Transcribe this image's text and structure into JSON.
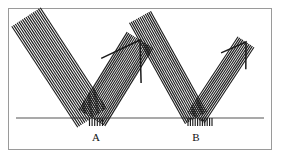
{
  "figure": {
    "background_color": "#ffffff",
    "frame": {
      "border_color": "#9a9a9a",
      "x": 8,
      "y": 8,
      "width": 264,
      "height": 142
    },
    "surface": {
      "name": "reflecting-surface-line",
      "color": "#8d8d8d",
      "x1": 16,
      "y1": 118,
      "x2": 264,
      "y2": 118,
      "stroke_width": 1.3
    },
    "labels": [
      {
        "id": "A",
        "text": "A",
        "x": 96,
        "y": 131,
        "color": "#111111"
      },
      {
        "id": "B",
        "text": "B",
        "x": 196,
        "y": 131,
        "color": "#111111"
      }
    ],
    "beam_color": "#1b1b1b",
    "beams": [
      {
        "id": "A",
        "label": "A",
        "incident": {
          "name": "incident-beam-a",
          "ray_count": 17,
          "width": 34,
          "angle_deg": 58,
          "start_x": 26,
          "start_y": 17,
          "hit_x": 92,
          "hit_y": 118,
          "has_arrowhead": false
        },
        "reflected": {
          "name": "reflected-beam-a",
          "ray_count": 17,
          "width": 30,
          "angle_deg": 52,
          "hit_x": 92,
          "hit_y": 118,
          "tip_x": 140,
          "tip_y": 40,
          "has_arrowhead": true
        },
        "contact_ticks": {
          "name": "contact-ticks-a",
          "count": 6,
          "x": 96,
          "y": 118,
          "length": 8,
          "spread": 13
        }
      },
      {
        "id": "B",
        "label": "B",
        "incident": {
          "name": "incident-beam-b",
          "ray_count": 13,
          "width": 24,
          "angle_deg": 63,
          "start_x": 140,
          "start_y": 17,
          "hit_x": 196,
          "hit_y": 118,
          "has_arrowhead": false
        },
        "reflected": {
          "name": "reflected-beam-b",
          "ray_count": 11,
          "width": 19,
          "angle_deg": 46,
          "hit_x": 196,
          "hit_y": 118,
          "tip_x": 246,
          "tip_y": 42,
          "has_arrowhead": true
        },
        "contact_ticks": {
          "name": "contact-ticks-b",
          "count": 11,
          "x": 200,
          "y": 118,
          "length": 8,
          "spread": 24
        }
      }
    ]
  }
}
